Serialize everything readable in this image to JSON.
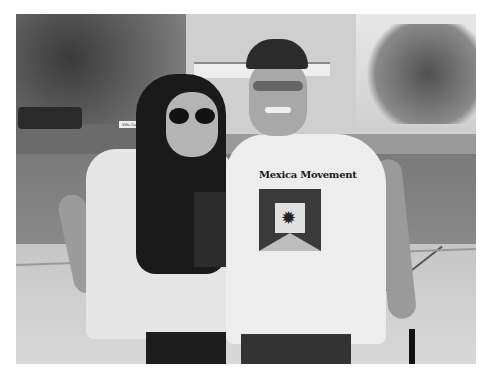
{
  "image": {
    "description": "Black and white photograph of a smiling young woman in large sunglasses and an older man in a baseball cap and glasses, both wearing white t-shirts, standing on a sidewalk in front of a street, trees, parked car and an apartment building.",
    "style": "grayscale",
    "background_color": "#ffffff"
  },
  "scene": {
    "background_sign_text": "Villa Carrer",
    "man_shirt_text": "Mexica Movement",
    "man_shirt_emblem": "emblem-icon",
    "woman_shirt_print": "partial graphic print"
  },
  "colors": {
    "photo_dark": "#1a1a1a",
    "photo_mid": "#8a8a8a",
    "photo_light": "#e6e6e6",
    "frame": "#ffffff"
  }
}
